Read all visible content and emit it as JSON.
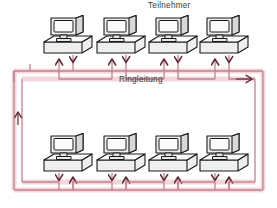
{
  "diagram": {
    "title_label": "Teilnehmer",
    "bus_label": "Ringleitung",
    "type": "network-ring-topology",
    "colors": {
      "line": "#c4808f",
      "line_glow": "#f2d4da",
      "arrow": "#7a3a48",
      "text": "#3a3a3a",
      "device_fill": "#f0f0f0",
      "device_outline": "#222222",
      "background": "#ffffff"
    },
    "nodes": {
      "count": 8,
      "top_row": [
        {
          "name": "node-top-1",
          "icon": "computer-icon",
          "x": 42,
          "y": 15
        },
        {
          "name": "node-top-2",
          "icon": "computer-icon",
          "x": 95,
          "y": 15
        },
        {
          "name": "node-top-3",
          "icon": "computer-icon",
          "x": 147,
          "y": 15
        },
        {
          "name": "node-top-4",
          "icon": "computer-icon",
          "x": 198,
          "y": 15
        }
      ],
      "bottom_row": [
        {
          "name": "node-bottom-1",
          "icon": "computer-icon",
          "x": 42,
          "y": 133
        },
        {
          "name": "node-bottom-2",
          "icon": "computer-icon",
          "x": 95,
          "y": 133
        },
        {
          "name": "node-bottom-3",
          "icon": "computer-icon",
          "x": 147,
          "y": 133
        },
        {
          "name": "node-bottom-4",
          "icon": "computer-icon",
          "x": 198,
          "y": 133
        }
      ]
    },
    "ring": {
      "direction_arrow": "right",
      "top_line_y": 71,
      "bottom_line_y": 190,
      "left_line_x": 14,
      "right_line_x": 263,
      "drop_arrow_pairs": 8,
      "drop_arrow_directions": [
        "up",
        "down"
      ]
    }
  }
}
